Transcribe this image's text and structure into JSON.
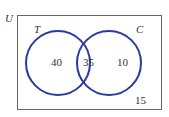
{
  "diagram": {
    "type": "venn",
    "universe_label": "U",
    "sets": [
      {
        "name": "T",
        "label": "T",
        "only_count": "40"
      },
      {
        "name": "C",
        "label": "C",
        "only_count": "10"
      }
    ],
    "intersection_count": "35",
    "outside_count": "15",
    "colors": {
      "circle_stroke": "#2b3aa0",
      "box_stroke": "#555555",
      "text": "#333333"
    }
  }
}
